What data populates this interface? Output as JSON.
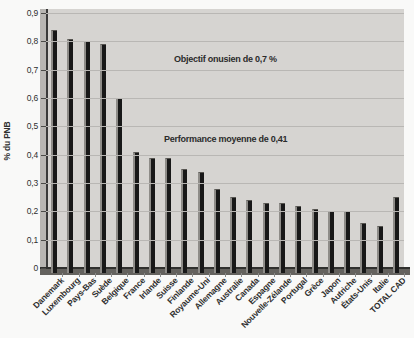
{
  "chart_data": {
    "type": "bar",
    "title": "",
    "ylabel": "% du PNB",
    "xlabel": "",
    "ylim": [
      0,
      0.9
    ],
    "ytick_step": 0.1,
    "ytick_labels": [
      "0",
      "0,1",
      "0,2",
      "0,3",
      "0,4",
      "0,5",
      "0,6",
      "0,7",
      "0,8",
      "0,9"
    ],
    "grid": true,
    "legend": false,
    "categories": [
      "Danemark",
      "Luxembourg",
      "Pays-Bas",
      "Suède",
      "Belgique",
      "France",
      "Irlande",
      "Suisse",
      "Finlande",
      "Royaume-Uni",
      "Allemagne",
      "Australie",
      "Canada",
      "Espagne",
      "Nouvelle-Zélande",
      "Portugal",
      "Grèce",
      "Japon",
      "Autriche",
      "États-Unis",
      "Italie",
      "TOTAL CAD"
    ],
    "values": [
      0.84,
      0.81,
      0.8,
      0.79,
      0.6,
      0.41,
      0.39,
      0.39,
      0.35,
      0.34,
      0.28,
      0.25,
      0.24,
      0.23,
      0.23,
      0.22,
      0.21,
      0.2,
      0.2,
      0.16,
      0.15,
      0.25
    ],
    "annotations": [
      {
        "text": "Objectif onusien de 0,7 %",
        "ref_value": 0.7
      },
      {
        "text": "Performance moyenne de 0,41",
        "ref_value": 0.41
      }
    ],
    "colors": {
      "bar": "#181818",
      "bar_highlight": "#8e8c88",
      "plot_bg": "#d6d4d1",
      "gridline": "#b9b7b4",
      "wall": "#b8b6b3",
      "floor": "#64625e",
      "axis": "#3a3a3a",
      "text": "#2f2f2f",
      "page_bg": "#f9f9f8"
    }
  }
}
